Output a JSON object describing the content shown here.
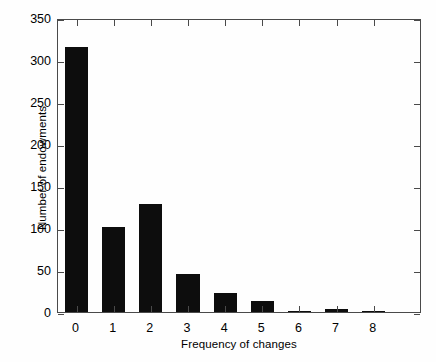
{
  "chart_data": {
    "type": "bar",
    "title": "",
    "subtitle": "",
    "xlabel": "Frequency of changes",
    "ylabel": "Number of endowments",
    "categories": [
      "0",
      "1",
      "2",
      "3",
      "4",
      "5",
      "6",
      "7",
      "8"
    ],
    "values": [
      315,
      101,
      129,
      45,
      23,
      13,
      1,
      3,
      1
    ],
    "series": [
      {
        "name": "Number of endowments",
        "values": [
          315,
          101,
          129,
          45,
          23,
          13,
          1,
          3,
          1
        ]
      }
    ],
    "xlim": [
      -0.5,
      9.3
    ],
    "ylim": [
      0,
      350
    ],
    "ytick_labels": [
      "0",
      "50",
      "100",
      "150",
      "200",
      "250",
      "300",
      "350"
    ],
    "ytick_values": [
      0,
      50,
      100,
      150,
      200,
      250,
      300,
      350
    ],
    "xtick_labels": [
      "0",
      "1",
      "2",
      "3",
      "4",
      "5",
      "6",
      "7",
      "8"
    ],
    "xtick_values": [
      0,
      1,
      2,
      3,
      4,
      5,
      6,
      7,
      8
    ],
    "grid": false,
    "legend": false,
    "legend_position": "none",
    "bar_color": "#0d0d0d",
    "axis_color": "#4a4a4a",
    "background_color": "#fefefe",
    "bar_width": 0.62,
    "annotations": []
  }
}
